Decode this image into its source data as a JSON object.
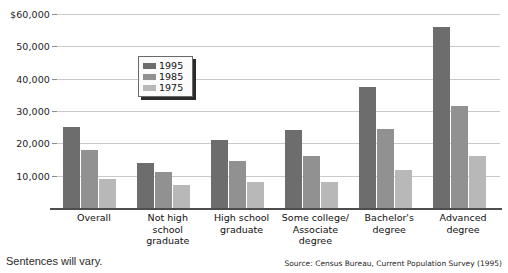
{
  "figure": {
    "title": "",
    "answer_note": "Sentences will vary.",
    "source_note": "Source: Census Bureau, Current Population Survey (1995)"
  },
  "legend": {
    "position": "inside-upper-left",
    "entries": [
      {
        "label": "1995",
        "color": "#6d6d6d"
      },
      {
        "label": "1985",
        "color": "#919191"
      },
      {
        "label": "1975",
        "color": "#b8b8b8"
      }
    ]
  },
  "axis": {
    "y_ticks": [
      "$60,000",
      "50,000",
      "40,000",
      "30,000",
      "20,000",
      "10,000"
    ],
    "y_tick_values": [
      60000,
      50000,
      40000,
      30000,
      20000,
      10000
    ]
  },
  "categories_display": [
    "Overall",
    "Not high\nschool\ngraduate",
    "High school\ngraduate",
    "Some college/\nAssociate\ndegree",
    "Bachelor's\ndegree",
    "Advanced\ndegree"
  ],
  "chart_data": {
    "type": "bar",
    "title": "",
    "xlabel": "",
    "ylabel": "",
    "ylim": [
      0,
      60000
    ],
    "grid": true,
    "legend_position": "inside-upper-left",
    "categories": [
      "Overall",
      "Not high school graduate",
      "High school graduate",
      "Some college/Associate degree",
      "Bachelor's degree",
      "Advanced degree"
    ],
    "series": [
      {
        "name": "1995",
        "color": "#6d6d6d",
        "values": [
          25000,
          14000,
          21000,
          24000,
          37500,
          56000
        ]
      },
      {
        "name": "1985",
        "color": "#919191",
        "values": [
          18000,
          11200,
          14500,
          16000,
          24500,
          31500
        ]
      },
      {
        "name": "1975",
        "color": "#b8b8b8",
        "values": [
          9000,
          7000,
          8200,
          8200,
          11800,
          16000
        ]
      }
    ],
    "source": "Source: Census Bureau, Current Population Survey (1995)"
  }
}
